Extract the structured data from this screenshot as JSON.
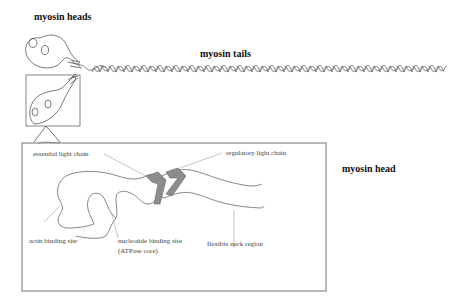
{
  "diagram": {
    "titles": {
      "heads": "myosin heads",
      "tails": "myosin tails",
      "head": "myosin head"
    },
    "labels": {
      "essential_light_chain": "essential light chain",
      "regulatory_light_chain": "regulatory light chain",
      "actin_binding_site": "actin binding site",
      "nucleotide_binding_site_line1": "nucleotide binding site",
      "nucleotide_binding_site_line2": "(ATPase core)",
      "flexible_neck_region": "flexible neck region"
    },
    "colors": {
      "outline": "#555555",
      "light_chain_fill": "#8c8c8c",
      "background": "#ffffff"
    }
  }
}
